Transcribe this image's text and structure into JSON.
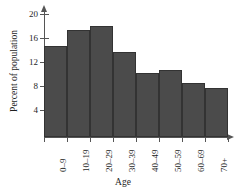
{
  "chart_data": {
    "type": "bar",
    "title": "",
    "xlabel": "Age",
    "ylabel": "Percent of population",
    "categories": [
      "0–9",
      "10–19",
      "20–29",
      "30–39",
      "40–49",
      "50–59",
      "60–69",
      "70+"
    ],
    "values": [
      14.6,
      17.3,
      18.0,
      13.7,
      10.2,
      10.6,
      8.5,
      7.6
    ],
    "ylim": [
      0,
      21.7
    ],
    "yticks": [
      4,
      8,
      12,
      16,
      20
    ],
    "ytick_labels": [
      "4",
      "8",
      "12",
      "16",
      "20"
    ],
    "grid": false,
    "legend": null,
    "bar_color": "#4b4b4b",
    "bar_edge_color": "#333333",
    "axis_color": "#555555",
    "background": "#ffffff"
  }
}
